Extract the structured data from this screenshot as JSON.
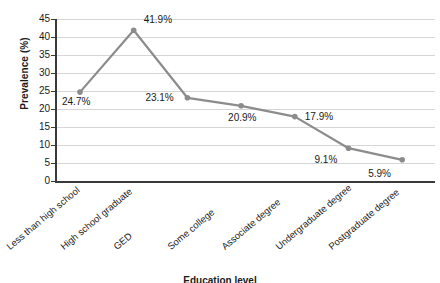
{
  "chart_data": {
    "type": "line",
    "title": "",
    "xlabel": "Education level",
    "ylabel": "Prevalence (%)",
    "ylim": [
      0,
      45
    ],
    "yticks": [
      0,
      5,
      10,
      15,
      20,
      25,
      30,
      35,
      40,
      45
    ],
    "ytick_labels": [
      "0",
      "5",
      "10",
      "15",
      "20",
      "25",
      "30",
      "35",
      "40",
      "45"
    ],
    "grid": true,
    "legend": "none",
    "categories": [
      "Less than high school",
      "High school graduate",
      "GED",
      "Some college",
      "Associate degree",
      "Undergraduate degree",
      "Postgraduate degree"
    ],
    "values": [
      24.7,
      41.9,
      23.1,
      20.9,
      17.9,
      9.1,
      5.9
    ],
    "data_labels": [
      "24.7%",
      "41.9%",
      "23.1%",
      "20.9%",
      "17.9%",
      "9.1%",
      "5.9%"
    ],
    "series": [
      {
        "name": "Prevalence",
        "values": [
          24.7,
          41.9,
          23.1,
          20.9,
          17.9,
          9.1,
          5.9
        ]
      }
    ],
    "colors": {
      "line": "#8c8c8c",
      "marker": "#8c8c8c",
      "grid": "#d6d6d6",
      "axis": "#3a3a3a",
      "text": "#1a1a1a",
      "background": "#ffffff"
    }
  }
}
